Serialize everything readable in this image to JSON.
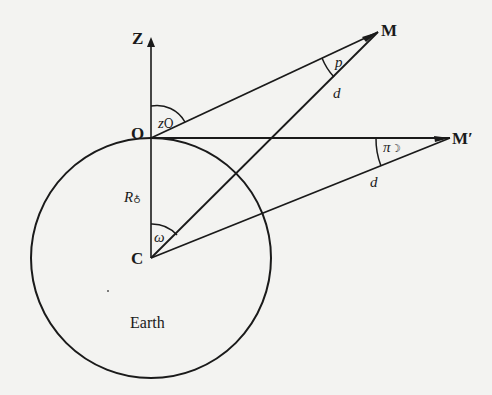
{
  "diagram": {
    "points": {
      "Z": "Z",
      "O": "O",
      "C": "C",
      "M": "M",
      "M_prime": "M′"
    },
    "angles": {
      "zenith_distance": "z",
      "zenith_distance_sub": "O",
      "parallax": "p",
      "horizontal_parallax": "π",
      "horizontal_parallax_sub": "☽",
      "omega": "ω"
    },
    "lengths": {
      "earth_radius": "R",
      "earth_radius_sub": "♁",
      "distance_OM": "d",
      "distance_CM_prime": "d"
    },
    "body_label": "Earth",
    "colors": {
      "ink": "#1a1a1a",
      "paper": "#f3f3f1"
    }
  }
}
